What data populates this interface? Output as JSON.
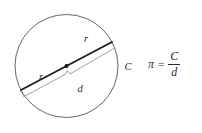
{
  "figure": {
    "type": "geometry-diagram",
    "background_color": "#ffffff",
    "circle": {
      "center_x": 66.5,
      "center_y": 66.0,
      "radius": 51.5,
      "stroke_color": "#555555",
      "stroke_width": 0.9
    },
    "diameter_line": {
      "x1": 21.0,
      "y1": 90.0,
      "x2": 112.0,
      "y2": 42.0,
      "stroke_color": "#1a1a1a",
      "stroke_width": 1.8
    },
    "center_dot": {
      "cx": 66.5,
      "cy": 66.0,
      "r": 1.9,
      "fill": "#111111"
    },
    "brace": {
      "stroke_color": "#8a8a8a",
      "stroke_width": 0.8
    },
    "labels": {
      "radius_upper": "r",
      "radius_lower": "r",
      "diameter": "d",
      "circumference": "C"
    }
  },
  "formula": {
    "pi": "π",
    "equals": "=",
    "numerator": "C",
    "denominator": "d"
  }
}
